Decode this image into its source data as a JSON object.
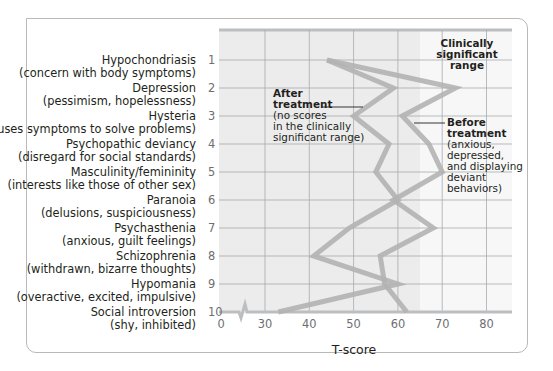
{
  "chart_data": {
    "type": "line",
    "orientation": "horizontal-profile",
    "title": "",
    "xlabel": "T-score",
    "ylabel": "",
    "xlim": [
      25,
      85
    ],
    "axis_break": true,
    "x_ticks": [
      "0",
      "30",
      "40",
      "50",
      "60",
      "70",
      "80"
    ],
    "x_tick_values": [
      0,
      30,
      40,
      50,
      60,
      70,
      80
    ],
    "grid": true,
    "clinical_threshold": 65,
    "categories": [
      {
        "num": "1",
        "name": "Hypochondriasis",
        "desc": "(concern with body symptoms)"
      },
      {
        "num": "2",
        "name": "Depression",
        "desc": "(pessimism, hopelessness)"
      },
      {
        "num": "3",
        "name": "Hysteria",
        "desc": "(uses symptoms to solve problems)"
      },
      {
        "num": "4",
        "name": "Psychopathic deviancy",
        "desc": "(disregard for social standards)"
      },
      {
        "num": "5",
        "name": "Masculinity/femininity",
        "desc": "(interests like those of other sex)"
      },
      {
        "num": "6",
        "name": "Paranoia",
        "desc": "(delusions, suspiciousness)"
      },
      {
        "num": "7",
        "name": "Psychasthenia",
        "desc": "(anxious, guilt feelings)"
      },
      {
        "num": "8",
        "name": "Schizophrenia",
        "desc": "(withdrawn, bizarre thoughts)"
      },
      {
        "num": "9",
        "name": "Hypomania",
        "desc": "(overactive, excited, impulsive)"
      },
      {
        "num": "10",
        "name": "Social introversion",
        "desc": "(shy, inhibited)"
      }
    ],
    "series": [
      {
        "name": "Before treatment",
        "values": [
          44,
          73,
          61,
          67,
          70,
          59,
          68,
          56,
          57,
          62
        ]
      },
      {
        "name": "After treatment",
        "values": [
          44,
          59,
          50,
          58,
          55,
          60,
          49,
          41,
          60,
          33
        ]
      }
    ],
    "annotations": {
      "clinical": [
        "Clinically",
        "significant",
        "range"
      ],
      "after_bold": [
        "After",
        "treatment"
      ],
      "after_text": [
        "(no scores",
        "in the clinically",
        "significant range)"
      ],
      "before_bold": [
        "Before",
        "treatment"
      ],
      "before_text": [
        "(anxious,",
        "depressed,",
        "and displaying",
        "deviant",
        "behaviors)"
      ]
    },
    "colors": {
      "shaded_region": "#ececec",
      "clinical_region": "#f7f7f7",
      "line": "#b3b3b3",
      "grid": "#a7a9ac"
    }
  }
}
